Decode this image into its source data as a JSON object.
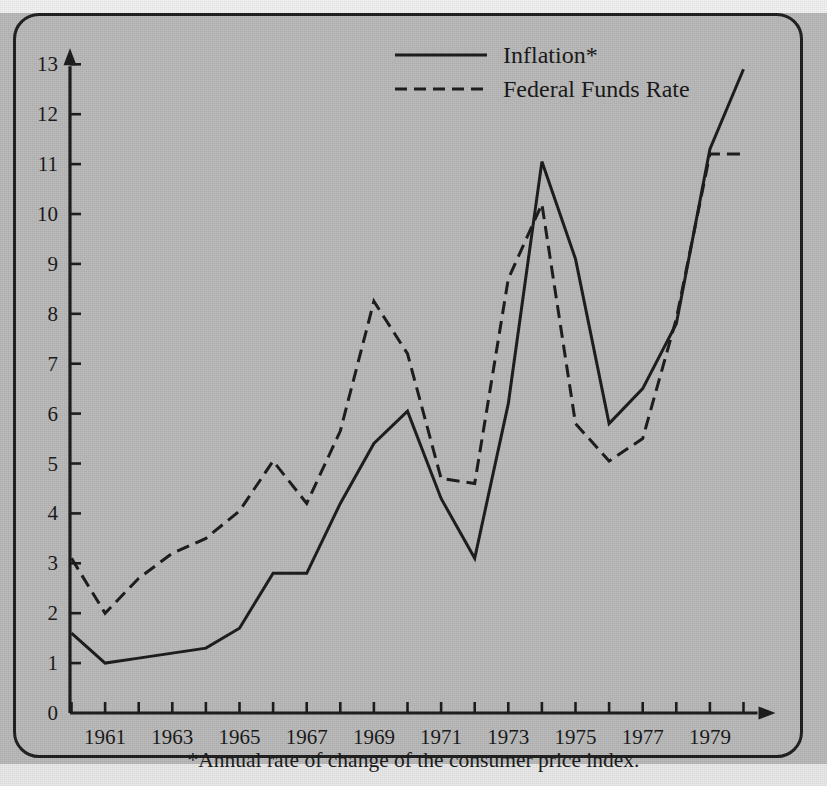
{
  "chart_data": {
    "type": "line",
    "title": "",
    "subtitle": "",
    "xlabel": "",
    "ylabel": "",
    "footnote": "*Annual rate of change of the consumer price index.",
    "grid": false,
    "legend_position": "top-center",
    "xlim": [
      1960,
      1980
    ],
    "ylim": [
      0,
      13
    ],
    "x": [
      1960,
      1961,
      1962,
      1963,
      1964,
      1965,
      1966,
      1967,
      1968,
      1969,
      1970,
      1971,
      1972,
      1973,
      1974,
      1975,
      1976,
      1977,
      1978,
      1979,
      1980
    ],
    "xticks": [
      1960,
      1961,
      1962,
      1963,
      1964,
      1965,
      1966,
      1967,
      1968,
      1969,
      1970,
      1971,
      1972,
      1973,
      1974,
      1975,
      1976,
      1977,
      1978,
      1979,
      1980
    ],
    "xtick_labels": [
      "1961",
      "1963",
      "1965",
      "1967",
      "1969",
      "1971",
      "1973",
      "1975",
      "1977",
      "1979"
    ],
    "xtick_label_values": [
      1961,
      1963,
      1965,
      1967,
      1969,
      1971,
      1973,
      1975,
      1977,
      1979
    ],
    "yticks": [
      0,
      1,
      2,
      3,
      4,
      5,
      6,
      7,
      8,
      9,
      10,
      11,
      12,
      13
    ],
    "ytick_labels": [
      "0",
      "1",
      "2",
      "3",
      "4",
      "5",
      "6",
      "7",
      "8",
      "9",
      "10",
      "11",
      "12",
      "13"
    ],
    "series": [
      {
        "name": "Inflation*",
        "style": "solid",
        "color": "#1d1d1d",
        "values": [
          1.6,
          1.0,
          1.1,
          1.2,
          1.3,
          1.7,
          2.8,
          2.8,
          4.2,
          5.4,
          6.05,
          4.3,
          3.1,
          6.2,
          11.05,
          9.1,
          5.8,
          6.5,
          7.8,
          11.3,
          12.9
        ]
      },
      {
        "name": "Federal Funds Rate",
        "style": "dashed",
        "color": "#1d1d1d",
        "values": [
          3.1,
          2.0,
          2.7,
          3.2,
          3.5,
          4.05,
          5.05,
          4.2,
          5.65,
          8.25,
          7.2,
          4.7,
          4.6,
          8.7,
          10.2,
          5.8,
          5.05,
          5.5,
          7.9,
          11.2,
          11.2
        ]
      }
    ]
  },
  "legend": {
    "items": [
      {
        "label": "Inflation*",
        "style": "solid"
      },
      {
        "label": "Federal Funds Rate",
        "style": "dashed"
      }
    ]
  }
}
